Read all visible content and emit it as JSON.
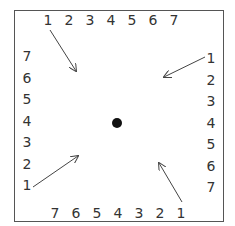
{
  "top_row": [
    "1",
    "2",
    "3",
    "4",
    "5",
    "6",
    "7"
  ],
  "left_col": [
    "7",
    "6",
    "5",
    "4",
    "3",
    "2",
    "1"
  ],
  "right_col": [
    "1",
    "2",
    "3",
    "4",
    "5",
    "6",
    "7"
  ],
  "bottom_row": [
    "7",
    "6",
    "5",
    "4",
    "3",
    "2",
    "1"
  ],
  "colors": {
    "frame": "#555555",
    "text": "#333333",
    "dot": "#111111",
    "arrow": "#444444"
  }
}
